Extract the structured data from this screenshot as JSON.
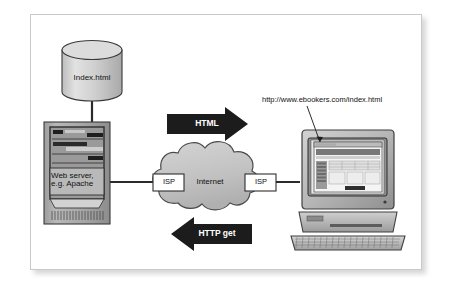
{
  "figure": {
    "background_color": "#ffffff",
    "plate_border_color": "#c9c9c9"
  },
  "nodes": {
    "database": {
      "name": "database-cylinder",
      "label": "Index.html",
      "fill": "#d0d0d0",
      "stroke": "#333333"
    },
    "server": {
      "name": "web-server-tower",
      "label_line1": "Web server,",
      "label_line2": "e.g. Apache",
      "fill": "#a8a8a8",
      "stroke": "#333333"
    },
    "cloud": {
      "name": "internet-cloud",
      "label": "Internet",
      "fill": "#c4c4c4",
      "stroke": "#444444"
    },
    "isp_left": {
      "name": "isp-box-left",
      "label": "ISP",
      "fill": "#ffffff",
      "stroke": "#333333"
    },
    "isp_right": {
      "name": "isp-box-right",
      "label": "ISP",
      "fill": "#ffffff",
      "stroke": "#333333"
    },
    "client": {
      "name": "client-computer",
      "fill": "#bdbdbd",
      "stroke": "#444444",
      "screen_fill": "#e8e8e8"
    }
  },
  "arrows": {
    "html": {
      "name": "html-response-arrow",
      "label": "HTML",
      "direction": "right",
      "fill": "#1c1c1c",
      "text_color": "#ffffff"
    },
    "http_get": {
      "name": "http-get-request-arrow",
      "label": "HTTP get",
      "direction": "left",
      "fill": "#1c1c1c",
      "text_color": "#ffffff"
    }
  },
  "annotations": {
    "url": {
      "name": "url-annotation",
      "text": "http://www.ebookers.com/index.html",
      "leader_line": true
    }
  },
  "connectors": {
    "db_to_server": "vertical",
    "server_to_isp_left": "horizontal",
    "isp_right_to_client": "horizontal"
  }
}
